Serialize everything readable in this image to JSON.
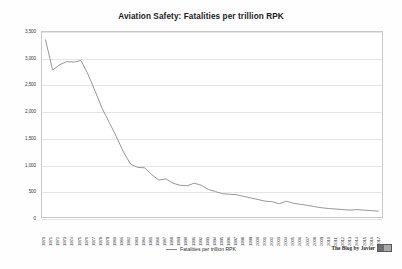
{
  "chart_data": {
    "type": "line",
    "title": "Aviation Safety: Fatalities per trillion RPK",
    "xlabel": "",
    "ylabel": "",
    "ylim": [
      0,
      3500
    ],
    "y_ticks": [
      0,
      500,
      1000,
      1500,
      2000,
      2500,
      3000,
      3500
    ],
    "y_tick_labels": [
      "0",
      "500",
      "1,000",
      "1,500",
      "2,000",
      "2,500",
      "3,000",
      "3,500"
    ],
    "grid": true,
    "legend_position": "bottom-center",
    "series": [
      {
        "name": "Fatalities per trillion RPK",
        "color": "#8a8a8a",
        "values": [
          3350,
          2780,
          2880,
          2940,
          2930,
          2960,
          2700,
          2380,
          2050,
          1790,
          1520,
          1230,
          1000,
          940,
          930,
          800,
          700,
          720,
          640,
          600,
          590,
          640,
          600,
          520,
          480,
          440,
          430,
          420,
          390,
          360,
          330,
          300,
          290,
          250,
          300,
          260,
          240,
          220,
          195,
          175,
          160,
          150,
          140,
          130,
          140,
          130,
          120,
          110
        ]
      }
    ],
    "categories": [
      "1970",
      "1971",
      "1972",
      "1973",
      "1974",
      "1975",
      "1976",
      "1977",
      "1978",
      "1979",
      "1980",
      "1981",
      "1982",
      "1983",
      "1984",
      "1985",
      "1986",
      "1987",
      "1988",
      "1989",
      "1990",
      "1991",
      "1992",
      "1993",
      "1994",
      "1995",
      "1996",
      "1997",
      "1998",
      "1999",
      "2000",
      "2001",
      "2002",
      "2003",
      "2004",
      "2005",
      "2006",
      "2007",
      "2008",
      "2009",
      "2010",
      "2011",
      "2012",
      "2013",
      "2014",
      "2015",
      "2016",
      "2017"
    ]
  },
  "legend": {
    "label": "Fatalities per trillion RPK"
  },
  "attribution": {
    "text": "The Blog by Javier"
  }
}
